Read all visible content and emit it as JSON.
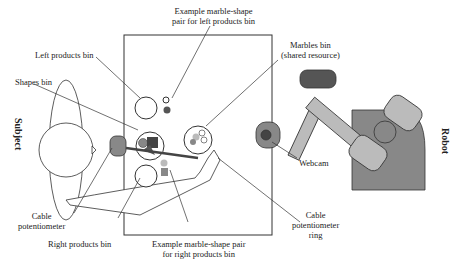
{
  "labels": {
    "example_left": [
      "Example marble-shape",
      "pair for left products bin"
    ],
    "left_products_bin": "Left products bin",
    "shapes_bin": "Shapes bin",
    "marbles_bin": [
      "Marbles bin",
      "(shared resource)"
    ],
    "webcam": "Webcam",
    "cable_pot": [
      "Cable",
      "potentiometer"
    ],
    "right_products_bin": "Right products bin",
    "example_right": [
      "Example marble-shape pair",
      "for right products bin"
    ],
    "cable_pot_ring": [
      "Cable",
      "potentiometer",
      "ring"
    ],
    "subject": "Subject",
    "robot": "Robot"
  },
  "colors": {
    "dark": "#555555",
    "mid": "#888888",
    "light": "#bbbbbb",
    "line": "#333333"
  }
}
